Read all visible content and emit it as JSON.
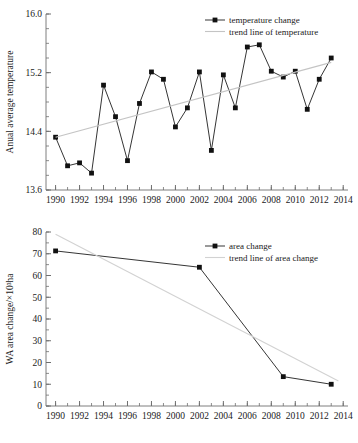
{
  "chart_data": [
    {
      "id": "temperature",
      "type": "line",
      "title": "",
      "xlabel": "",
      "ylabel": "Anual average temperature",
      "xlim": [
        1989.2,
        2014.4
      ],
      "ylim": [
        13.6,
        16.0
      ],
      "yticks": [
        13.6,
        14.4,
        15.2,
        16.0
      ],
      "ytick_labels": [
        "13.6",
        "14.4",
        "15.2",
        "16.0"
      ],
      "yminor_step": 0.2,
      "xticks": [
        1990,
        1992,
        1994,
        1996,
        1998,
        2000,
        2002,
        2004,
        2006,
        2008,
        2010,
        2012,
        2014
      ],
      "xtick_labels": [
        "1990",
        "1992",
        "1994",
        "1996",
        "1998",
        "2000",
        "2002",
        "2004",
        "2006",
        "2008",
        "2010",
        "2012",
        "2014"
      ],
      "xminor_step": 1,
      "grid": false,
      "legend_position": "top-right",
      "series": [
        {
          "name": "temperature change",
          "marker": "square",
          "color": "#111111",
          "x": [
            1990,
            1991,
            1992,
            1993,
            1994,
            1995,
            1996,
            1997,
            1998,
            1999,
            2000,
            2001,
            2002,
            2003,
            2004,
            2005,
            2006,
            2007,
            2008,
            2009,
            2010,
            2011,
            2012,
            2013
          ],
          "values": [
            14.32,
            13.93,
            13.97,
            13.83,
            15.03,
            14.6,
            14.0,
            14.78,
            15.21,
            15.11,
            14.46,
            14.72,
            15.21,
            14.14,
            15.17,
            14.72,
            15.55,
            15.58,
            15.22,
            15.14,
            15.22,
            14.7,
            15.11,
            15.4
          ]
        },
        {
          "name": "trend line of temperature",
          "marker": "none",
          "color": "#c4c4c4",
          "x": [
            1990,
            2013
          ],
          "values": [
            14.32,
            15.34
          ]
        }
      ]
    },
    {
      "id": "area",
      "type": "line",
      "title": "",
      "xlabel": "",
      "ylabel": "WA area change/×10³ha",
      "xlim": [
        1989.2,
        2014.4
      ],
      "ylim": [
        0,
        80
      ],
      "yticks": [
        0,
        10,
        20,
        30,
        40,
        50,
        60,
        70,
        80
      ],
      "ytick_labels": [
        "0",
        "10",
        "20",
        "30",
        "40",
        "50",
        "60",
        "70",
        "80"
      ],
      "yminor_step": 5,
      "xticks": [
        1990,
        1992,
        1994,
        1996,
        1998,
        2000,
        2002,
        2004,
        2006,
        2008,
        2010,
        2012,
        2014
      ],
      "xtick_labels": [
        "1990",
        "1992",
        "1994",
        "1996",
        "1998",
        "2000",
        "2002",
        "2004",
        "2006",
        "2008",
        "2010",
        "2012",
        "2014"
      ],
      "xminor_step": 1,
      "grid": false,
      "legend_position": "top-right",
      "series": [
        {
          "name": "area change",
          "marker": "square",
          "color": "#111111",
          "x": [
            1990,
            2002,
            2009,
            2013
          ],
          "values": [
            71.3,
            63.8,
            13.5,
            10.0
          ]
        },
        {
          "name": "trend line of area change",
          "marker": "none",
          "color": "#d2d2d2",
          "x": [
            1990,
            2013.6
          ],
          "values": [
            79.0,
            11.5
          ]
        }
      ]
    }
  ],
  "figures": {
    "top": {
      "name": "annual-average-temperature-chart",
      "ylabel": "Anual average temperature",
      "legend": [
        {
          "label": "temperature change",
          "kind": "line-marker"
        },
        {
          "label": "trend line of temperature",
          "kind": "line"
        }
      ]
    },
    "bottom": {
      "name": "wa-area-change-chart",
      "ylabel": "WA area change/×10³ha",
      "legend": [
        {
          "label": "area change",
          "kind": "line-marker"
        },
        {
          "label": "trend line of area change",
          "kind": "line"
        }
      ]
    }
  },
  "colors": {
    "series": "#111111",
    "trend": "#c9c9c9",
    "axis": "#6f6f6f",
    "text": "#1a1a1a",
    "background": "#ffffff"
  }
}
